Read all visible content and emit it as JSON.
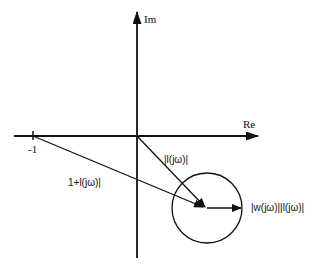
{
  "diagram": {
    "type": "nyquist-uncertainty-disc",
    "axes": {
      "imaginary_label": "Im",
      "real_label": "Re",
      "tick_label": "-1"
    },
    "vectors": {
      "loop_vector_label": "|l(jω)|",
      "return_difference_label": "1+l(jω)|",
      "uncertainty_radius_label": "|w(jω)||l(jω)|"
    },
    "colors": {
      "stroke": "#111111",
      "background": "#ffffff"
    }
  }
}
